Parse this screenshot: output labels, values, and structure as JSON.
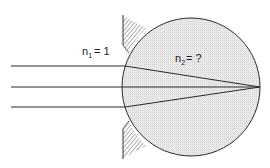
{
  "diagram": {
    "medium1": {
      "symbol": "n",
      "subscript": "1",
      "value": "= 1"
    },
    "medium2": {
      "symbol": "n",
      "subscript": "2",
      "value": "= ?"
    },
    "colors": {
      "sphere_fill": "#e6e6e6",
      "line": "#2a2a2a",
      "hatch": "#444444"
    }
  }
}
